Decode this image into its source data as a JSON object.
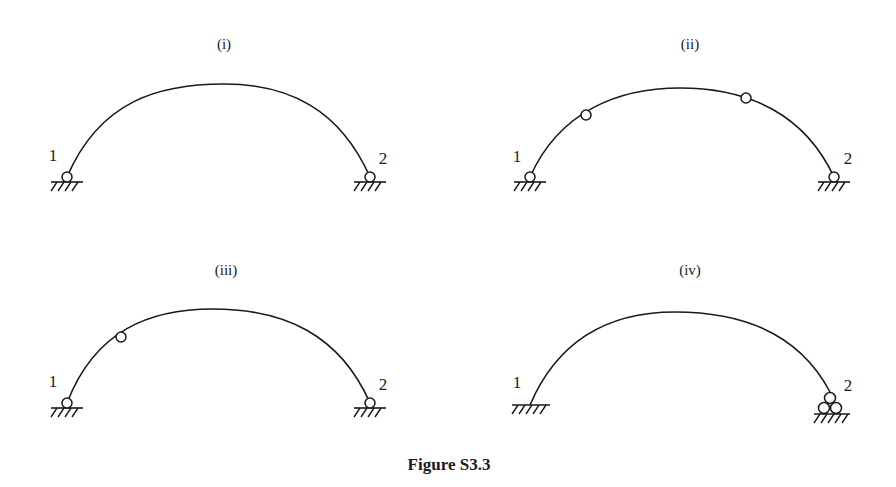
{
  "figure": {
    "caption": "Figure S3.3"
  },
  "panels": [
    {
      "id": "i",
      "title": "(i)",
      "node_labels": [
        "1",
        "2"
      ],
      "support_left": "pinned",
      "support_right": "pinned",
      "internal_hinges": 0
    },
    {
      "id": "ii",
      "title": "(ii)",
      "node_labels": [
        "1",
        "2"
      ],
      "support_left": "pinned",
      "support_right": "pinned",
      "internal_hinges": 2
    },
    {
      "id": "iii",
      "title": "(iii)",
      "node_labels": [
        "1",
        "2"
      ],
      "support_left": "pinned",
      "support_right": "pinned",
      "internal_hinges": 1
    },
    {
      "id": "iv",
      "title": "(iv)",
      "node_labels": [
        "1",
        "2"
      ],
      "support_left": "fixed",
      "support_right": "roller",
      "internal_hinges": 0
    }
  ],
  "colors": {
    "ink": "#1a1a1a",
    "background": "#ffffff"
  }
}
